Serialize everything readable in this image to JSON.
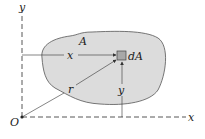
{
  "diagram": {
    "labels": {
      "y_axis": "y",
      "x_axis": "x",
      "origin": "O",
      "region": "A",
      "element": "dA",
      "x_distance": "x",
      "y_distance": "y",
      "radius": "r"
    },
    "colors": {
      "region_fill": "#dcdcdc",
      "element_fill": "#a8a8a8",
      "lines": "#333333",
      "axes": "#444444"
    }
  }
}
